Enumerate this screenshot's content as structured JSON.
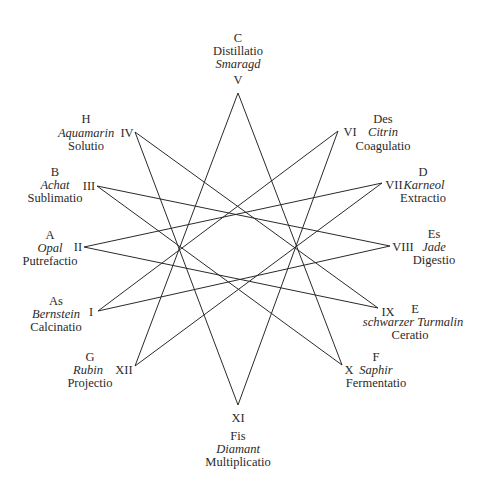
{
  "diagram": {
    "type": "twelve-pointed star polygon {12/5}",
    "line_color": "#2a2a2a",
    "background": "#ffffff",
    "vertices": [
      {
        "numeral": "I",
        "x": 98,
        "y": 311
      },
      {
        "numeral": "II",
        "x": 84,
        "y": 247
      },
      {
        "numeral": "III",
        "x": 97,
        "y": 186
      },
      {
        "numeral": "IV",
        "x": 135,
        "y": 132
      },
      {
        "numeral": "V",
        "x": 238,
        "y": 93
      },
      {
        "numeral": "VI",
        "x": 338,
        "y": 131
      },
      {
        "numeral": "VII",
        "x": 382,
        "y": 183
      },
      {
        "numeral": "VIII",
        "x": 390,
        "y": 246
      },
      {
        "numeral": "IX",
        "x": 378,
        "y": 308
      },
      {
        "numeral": "X",
        "x": 342,
        "y": 365
      },
      {
        "numeral": "XI",
        "x": 238,
        "y": 405
      },
      {
        "numeral": "XII",
        "x": 135,
        "y": 366
      }
    ],
    "edges": [
      [
        "V",
        "X"
      ],
      [
        "V",
        "XII"
      ],
      [
        "VI",
        "XI"
      ],
      [
        "VI",
        "I"
      ],
      [
        "VII",
        "XII"
      ],
      [
        "VII",
        "II"
      ],
      [
        "VIII",
        "I"
      ],
      [
        "VIII",
        "III"
      ],
      [
        "IX",
        "II"
      ],
      [
        "IX",
        "IV"
      ],
      [
        "X",
        "III"
      ],
      [
        "XI",
        "IV"
      ]
    ],
    "labels": {
      "I": {
        "letter": "As",
        "stone": "Bernstein",
        "process": "Calcinatio"
      },
      "II": {
        "letter": "A",
        "stone": "Opal",
        "process": "Putrefactio"
      },
      "III": {
        "letter": "B",
        "stone": "Achat",
        "process": "Sublimatio"
      },
      "IV": {
        "letter": "H",
        "stone": "Aquamarin",
        "process": "Solutio"
      },
      "V": {
        "letter": "C",
        "stone": "Smaragd",
        "process": "Distillatio"
      },
      "VI": {
        "letter": "Des",
        "stone": "Citrin",
        "process": "Coagulatio"
      },
      "VII": {
        "letter": "D",
        "stone": "Karneol",
        "process": "Extractio"
      },
      "VIII": {
        "letter": "Es",
        "stone": "Jade",
        "process": "Digestio"
      },
      "IX": {
        "letter": "E",
        "stone": "schwarzer Turmalin",
        "process": "Ceratio"
      },
      "X": {
        "letter": "F",
        "stone": "Saphir",
        "process": "Fermentatio"
      },
      "XI": {
        "letter": "Fis",
        "stone": "Diamant",
        "process": "Multiplicatio"
      },
      "XII": {
        "letter": "G",
        "stone": "Rubin",
        "process": "Projectio"
      }
    }
  }
}
